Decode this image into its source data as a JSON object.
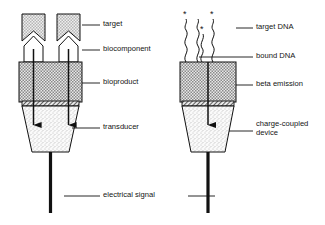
{
  "figure": {
    "type": "biosensor-schematic",
    "panels": [
      {
        "id": "left",
        "name": "enzyme-biosensor",
        "labels": [
          {
            "key": "target",
            "text": "target",
            "x": 103,
            "y": 22,
            "leader": {
              "x1": 82,
              "y1": 25,
              "x2": 100,
              "y2": 25
            }
          },
          {
            "key": "biocomponent",
            "text": "biocomponent",
            "x": 103,
            "y": 47,
            "leader": {
              "x1": 82,
              "y1": 50,
              "x2": 100,
              "y2": 50
            }
          },
          {
            "key": "bioproduct",
            "text": "bioproduct",
            "x": 103,
            "y": 80,
            "leader": {
              "x1": 82,
              "y1": 83,
              "x2": 100,
              "y2": 83
            }
          },
          {
            "key": "transducer",
            "text": "transducer",
            "x": 103,
            "y": 125,
            "leader": {
              "x1": 72,
              "y1": 128,
              "x2": 100,
              "y2": 128
            }
          },
          {
            "key": "electrical_signal",
            "text": "electrical signal",
            "x": 103,
            "y": 193,
            "leader": {
              "x1": 64,
              "y1": 196,
              "x2": 100,
              "y2": 196
            }
          }
        ]
      },
      {
        "id": "right",
        "name": "dna-probe-biosensor",
        "labels": [
          {
            "key": "target_dna",
            "text": "target DNA",
            "x": 256,
            "y": 25,
            "leader": {
              "x1": 236,
              "y1": 28,
              "x2": 253,
              "y2": 28
            }
          },
          {
            "key": "bound_dna",
            "text": "bound DNA",
            "x": 256,
            "y": 54,
            "leader": {
              "x1": 199,
              "y1": 57,
              "x2": 253,
              "y2": 57
            }
          },
          {
            "key": "beta_emission",
            "text": "beta emission",
            "x": 256,
            "y": 82,
            "leader": {
              "x1": 236,
              "y1": 85,
              "x2": 253,
              "y2": 85
            }
          },
          {
            "key": "ccd",
            "text": "charge-coupled device",
            "x": 256,
            "y": 128,
            "leader": {
              "x1": 229,
              "y1": 131,
              "x2": 253,
              "y2": 131
            }
          }
        ]
      }
    ],
    "shared": {
      "electrical_signal_right_leader": {
        "x1": 188,
        "y1": 196,
        "x2": 215,
        "y2": 196
      }
    },
    "markers": {
      "asterisk": "*",
      "asterisk_count": 3
    },
    "colors": {
      "stroke": "#111111",
      "target_fill": "#c9c9c9",
      "bioproduct_fill": "#a8a8a8",
      "transducer_fill": "#f2f2f2",
      "stem": "#111111",
      "background": "#ffffff"
    }
  }
}
